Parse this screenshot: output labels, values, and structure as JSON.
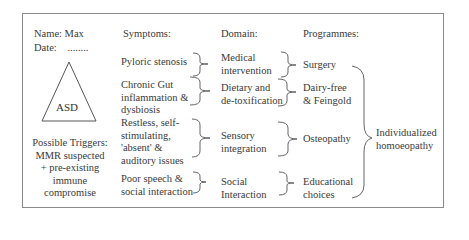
{
  "patient": {
    "name_label": "Name: Max",
    "date_label": "Date:",
    "date_value": "........"
  },
  "diagnosis": {
    "shape": "triangle",
    "label": "ASD"
  },
  "triggers": {
    "lines": [
      "Possible Triggers:",
      "MMR suspected",
      "+ pre-existing",
      "immune",
      "compromise"
    ]
  },
  "columns": {
    "symptoms": "Symptoms:",
    "domain": "Domain:",
    "programmes": "Programmes:"
  },
  "rows": [
    {
      "symptom": [
        "Pyloric stenosis"
      ],
      "domain": [
        "Medical",
        "intervention"
      ],
      "programme": [
        "Surgery"
      ]
    },
    {
      "symptom": [
        "Chronic Gut",
        "inflammation &",
        "dysbiosis"
      ],
      "domain": [
        "Dietary and",
        "de-toxification"
      ],
      "programme": [
        "Dairy-free",
        "& Feingold"
      ]
    },
    {
      "symptom": [
        "Restless, self-",
        "stimulating,",
        "'absent' &",
        "auditory issues"
      ],
      "domain": [
        "Sensory",
        "integration"
      ],
      "programme": [
        "Osteopathy"
      ]
    },
    {
      "symptom": [
        "Poor speech &",
        "social interaction"
      ],
      "domain": [
        "Social",
        "Interaction"
      ],
      "programme": [
        "Educational",
        "choices"
      ]
    }
  ],
  "overall": {
    "lines": [
      "Individualized",
      "homoeopathy"
    ]
  },
  "colors": {
    "text": "#3a3a3a",
    "lines": "#555555",
    "frame": "#8a8a8a"
  }
}
